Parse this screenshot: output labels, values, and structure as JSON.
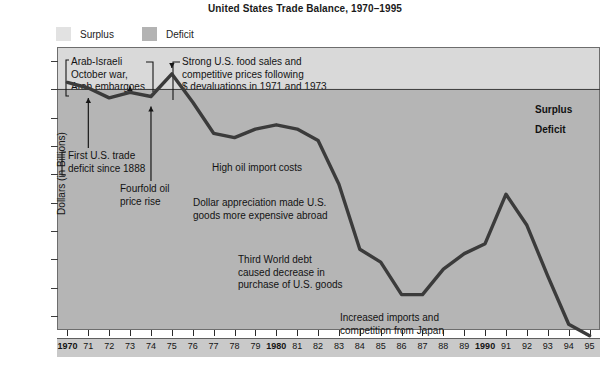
{
  "chart_data": {
    "type": "line",
    "title": "United States Trade Balance, 1970–1995",
    "xlabel": "",
    "ylabel": "Dollars (in Billions)",
    "ylim": [
      -170,
      30
    ],
    "xlim": [
      1970,
      1995
    ],
    "grid": false,
    "legend_position": "top-left",
    "legend": [
      {
        "label": "Surplus",
        "color": "#e2e2e2"
      },
      {
        "label": "Deficit",
        "color": "#b3b3b3"
      }
    ],
    "ytick_labels": [
      "20",
      "0",
      "–20",
      "–40",
      "–60",
      "–80",
      "–100",
      "–120",
      "–140",
      "–160"
    ],
    "ytick_values": [
      20,
      0,
      -20,
      -40,
      -60,
      -80,
      -100,
      -120,
      -140,
      -160
    ],
    "xtick_labels": [
      "1970",
      "71",
      "72",
      "73",
      "74",
      "75",
      "76",
      "77",
      "78",
      "79",
      "1980",
      "81",
      "82",
      "83",
      "84",
      "85",
      "86",
      "87",
      "88",
      "89",
      "1990",
      "91",
      "92",
      "93",
      "94",
      "95"
    ],
    "x": [
      1970,
      1971,
      1972,
      1973,
      1974,
      1975,
      1976,
      1977,
      1978,
      1979,
      1980,
      1981,
      1982,
      1983,
      1984,
      1985,
      1986,
      1987,
      1988,
      1989,
      1990,
      1991,
      1992,
      1993,
      1994,
      1995
    ],
    "values": [
      5,
      1,
      -6,
      -2,
      -5,
      11,
      -9,
      -31,
      -34,
      -28,
      -25,
      -28,
      -36,
      -67,
      -113,
      -122,
      -145,
      -145,
      -127,
      -116,
      -109,
      -74,
      -96,
      -132,
      -166,
      -174
    ],
    "series": [
      {
        "name": "U.S. Trade Balance",
        "color": "#3b3b3b",
        "values": [
          5,
          1,
          -6,
          -2,
          -5,
          11,
          -9,
          -31,
          -34,
          -28,
          -25,
          -28,
          -36,
          -67,
          -113,
          -122,
          -145,
          -145,
          -127,
          -116,
          -109,
          -74,
          -96,
          -132,
          -166,
          -174
        ]
      }
    ],
    "zero_line_labels": {
      "above": "Surplus",
      "below": "Deficit"
    },
    "annotations": [
      {
        "name": "arab-israeli",
        "text": "Arab-Israeli\nOctober war,\nArab embargoes",
        "points_to_year": 1973
      },
      {
        "name": "strong-food-sales",
        "text": "Strong U.S. food sales and\ncompetitive prices following\n$ devaluations in 1971 and 1973",
        "points_to_year": 1975
      },
      {
        "name": "first-trade-deficit",
        "text": "First U.S. trade\ndeficit since 1888",
        "points_to_year": 1971
      },
      {
        "name": "fourfold-oil-price",
        "text": "Fourfold oil\nprice rise",
        "points_to_year": 1974
      },
      {
        "name": "high-oil-import-costs",
        "text": "High oil import costs",
        "points_to_year": 1978
      },
      {
        "name": "dollar-appreciation",
        "text": "Dollar appreciation made U.S.\ngoods more expensive abroad",
        "points_to_year": 1982
      },
      {
        "name": "third-world-debt",
        "text": "Third World debt\ncaused decrease in\npurchase of U.S. goods",
        "points_to_year": 1984
      },
      {
        "name": "increased-imports-japan",
        "text": "Increased imports and\ncompetition from Japan",
        "points_to_year": 1987
      }
    ]
  },
  "title": "United States Trade Balance, 1970–1995",
  "legend": {
    "surplus_label": "Surplus",
    "deficit_label": "Deficit"
  },
  "axis": {
    "y_title": "Dollars (in Billions)",
    "y_ticks": [
      "20",
      "0",
      "–20",
      "–40",
      "–60",
      "–80",
      "–100",
      "–120",
      "–140",
      "–160"
    ],
    "x_ticks": [
      "1970",
      "71",
      "72",
      "73",
      "74",
      "75",
      "76",
      "77",
      "78",
      "79",
      "1980",
      "81",
      "82",
      "83",
      "84",
      "85",
      "86",
      "87",
      "88",
      "89",
      "1990",
      "91",
      "92",
      "93",
      "94",
      "95"
    ]
  },
  "plot_labels": {
    "surplus": "Surplus",
    "deficit": "Deficit"
  },
  "annotations": {
    "arab_israeli_l1": "Arab-Israeli",
    "arab_israeli_l2": "October war,",
    "arab_israeli_l3": "Arab embargoes",
    "strong_food_l1": "Strong U.S. food sales and",
    "strong_food_l2": "competitive prices following",
    "strong_food_l3": "$ devaluations in 1971 and 1973",
    "first_deficit_l1": "First U.S. trade",
    "first_deficit_l2": "deficit since 1888",
    "fourfold_l1": "Fourfold oil",
    "fourfold_l2": "price rise",
    "high_oil": "High oil import costs",
    "dollar_l1": "Dollar appreciation made U.S.",
    "dollar_l2": "goods more expensive abroad",
    "third_world_l1": "Third World debt",
    "third_world_l2": "caused decrease in",
    "third_world_l3": "purchase of U.S. goods",
    "japan_l1": "Increased imports and",
    "japan_l2": "competition from Japan"
  },
  "colors": {
    "plot_deficit_fill": "#b5b5b5",
    "plot_surplus_fill": "#d9d9d9",
    "line": "#3b3b3b",
    "frame": "#6d6d6d"
  }
}
